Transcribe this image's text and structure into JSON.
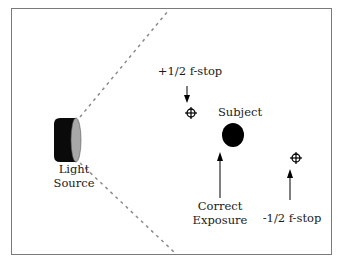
{
  "diagram": {
    "type": "lighting-exposure-diagram",
    "labels": {
      "light_source_line1": "Light",
      "light_source_line2": "Source",
      "subject": "Subject",
      "correct_exposure_line1": "Correct",
      "correct_exposure_line2": "Exposure",
      "plus_half_stop": "+1/2 f-stop",
      "minus_half_stop": "-1/2 f-stop"
    },
    "icons": [
      "light-source-icon",
      "subject-circle-icon",
      "crosshair-icon",
      "crosshair-icon",
      "arrow-icon"
    ],
    "colors": {
      "frame": "#7a7a7a",
      "ink": "#000000",
      "light_face": "#9a9a9a",
      "dashes": "#888888"
    }
  }
}
